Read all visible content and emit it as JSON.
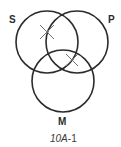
{
  "diagram": {
    "type": "venn-3",
    "circles": [
      {
        "id": "S",
        "label": "S",
        "cx": 47,
        "cy": 42,
        "r": 31
      },
      {
        "id": "P",
        "label": "P",
        "cx": 77,
        "cy": 42,
        "r": 31
      },
      {
        "id": "M",
        "label": "M",
        "cx": 63,
        "cy": 81,
        "r": 31
      }
    ],
    "marks": [
      {
        "type": "x",
        "region": "S∩P outside M",
        "cx": 47,
        "cy": 32
      },
      {
        "type": "x",
        "region": "P∩M outside S",
        "cx": 72,
        "cy": 60
      }
    ],
    "colors": {
      "stroke": "#2b2b2b",
      "mark": "#6e6e6e",
      "background": "#ffffff"
    }
  },
  "labels": {
    "s": "S",
    "p": "P",
    "m": "M"
  },
  "caption": {
    "italic_part": "10A",
    "plain_part": "-1"
  }
}
